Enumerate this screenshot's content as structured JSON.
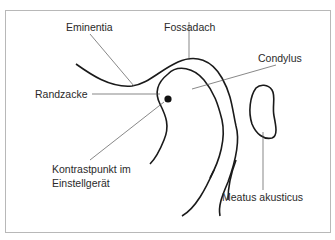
{
  "diagram": {
    "labels": {
      "eminentia": "Eminentia",
      "fossadach": "Fossadach",
      "condylus": "Condylus",
      "randzacke": "Randzacke",
      "kontrastpunkt_line1": "Kontrastpunkt im",
      "kontrastpunkt_line2": "Einstellgerät",
      "meatus": "Meatus akusticus"
    },
    "colors": {
      "outline": "#1a1a1a",
      "leader": "#555555",
      "frame": "#b8b8b8"
    }
  }
}
